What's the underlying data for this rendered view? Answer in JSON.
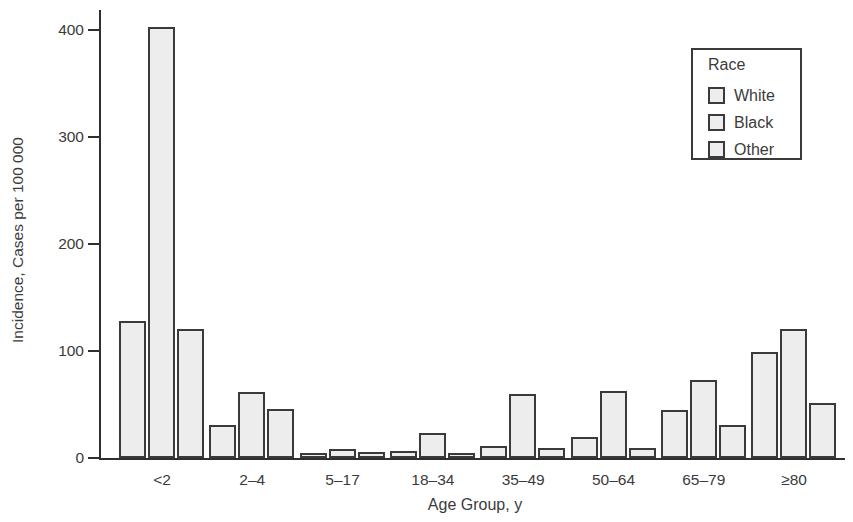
{
  "legend": {
    "title": "Race",
    "items": [
      "White",
      "Black",
      "Other"
    ]
  },
  "chart_data": {
    "type": "bar",
    "title": "",
    "xlabel": "Age Group, y",
    "ylabel": "Incidence, Cases per 100 000",
    "categories": [
      "<2",
      "2–4",
      "5–17",
      "18–34",
      "35–49",
      "50–64",
      "65–79",
      "≥80"
    ],
    "series": [
      {
        "name": "White",
        "values": [
          128,
          31,
          5,
          7,
          11,
          20,
          45,
          99
        ]
      },
      {
        "name": "Black",
        "values": [
          403,
          62,
          8,
          23,
          60,
          63,
          73,
          121
        ]
      },
      {
        "name": "Other",
        "values": [
          121,
          46,
          6,
          5,
          9,
          9,
          31,
          51
        ]
      }
    ],
    "ylim": [
      0,
      420
    ],
    "yticks": [
      0,
      100,
      200,
      300,
      400
    ],
    "grid": false,
    "legend_position": "top-right",
    "legend_title": "Race",
    "bar_fill": "#ededed",
    "bar_border": "#3a3a3a"
  },
  "colors": {
    "bar_fill": "#ededed",
    "bar_border": "#3a3a3a",
    "axis": "#2f2f2f",
    "text": "#3b3b3b",
    "background": "#ffffff"
  }
}
